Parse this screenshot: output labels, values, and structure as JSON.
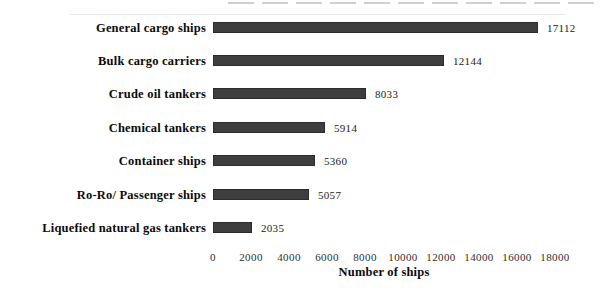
{
  "chart_data": {
    "type": "bar",
    "orientation": "horizontal",
    "title": "",
    "xlabel": "Number of ships",
    "ylabel": "",
    "categories": [
      "General cargo ships",
      "Bulk cargo carriers",
      "Crude oil tankers",
      "Chemical tankers",
      "Container ships",
      "Ro-Ro/ Passenger ships",
      "Liquefied natural gas tankers"
    ],
    "values": [
      17112,
      12144,
      8033,
      5914,
      5360,
      5057,
      2035
    ],
    "xlim": [
      0,
      18000
    ],
    "xticks": [
      0,
      2000,
      4000,
      6000,
      8000,
      10000,
      12000,
      14000,
      16000,
      18000
    ],
    "grid": false,
    "legend": null,
    "bar_color": "#3e3e3e",
    "bar_border_color": "#2b2b2b",
    "background_color": "#ffffff",
    "text_color": "#0a0a0a"
  }
}
